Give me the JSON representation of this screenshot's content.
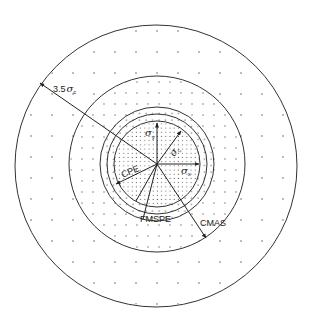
{
  "diagram": {
    "type": "concentric-error-circles",
    "center": [
      157,
      164
    ],
    "colors": {
      "line": "#333333",
      "dot": "#555555",
      "background": "#ffffff"
    },
    "circles": [
      {
        "id": "outer",
        "radius": 141,
        "meaning": "3.5 sigma_c"
      },
      {
        "id": "cmas",
        "radius": 88,
        "meaning": "CMAS"
      },
      {
        "id": "fmspe",
        "radius": 57,
        "meaning": "FMSPE"
      },
      {
        "id": "ring-mid",
        "radius": 50
      },
      {
        "id": "cpe",
        "radius": 43,
        "meaning": "CPE / sigma"
      }
    ],
    "labels": {
      "three_point_five_sigma": {
        "prefix": "3.5",
        "symbol": "σ",
        "subscript": "c"
      },
      "sigma_y": {
        "symbol": "σ",
        "subscript": "y"
      },
      "sigma_c": {
        "symbol": "σ",
        "subscript": "c"
      },
      "sigma_x": {
        "symbol": "σ",
        "subscript": "x"
      },
      "cpe": "CPE",
      "fmspe": "FMSPE",
      "cmas": "CMAS"
    },
    "arrows": [
      {
        "name": "sigma-y-arrow",
        "from": [
          157,
          164
        ],
        "to": [
          157,
          123
        ]
      },
      {
        "name": "sigma-c-arrow",
        "from": [
          157,
          164
        ],
        "to": [
          181,
          131
        ]
      },
      {
        "name": "sigma-x-arrow",
        "from": [
          157,
          164
        ],
        "to": [
          199,
          164
        ]
      },
      {
        "name": "cpe-arrow",
        "from": [
          157,
          164
        ],
        "to": [
          116,
          184
        ]
      },
      {
        "name": "fmspe-line",
        "from": [
          157,
          164
        ],
        "to": [
          143,
          220
        ]
      },
      {
        "name": "cmas-arrow",
        "from": [
          157,
          164
        ],
        "to": [
          206,
          238
        ]
      },
      {
        "name": "three-point-five-sigma-arrow",
        "from": [
          157,
          164
        ],
        "to": [
          40,
          83
        ]
      }
    ]
  }
}
